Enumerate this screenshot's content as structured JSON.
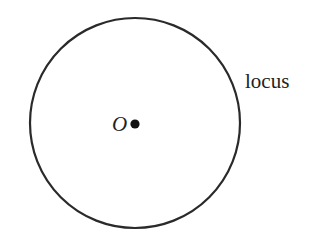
{
  "diagram": {
    "type": "locus-circle",
    "center_point": {
      "label": "O",
      "cx": 135,
      "cy": 124
    },
    "circle": {
      "cx": 135,
      "cy": 123,
      "r": 105,
      "stroke": "#2a2a2a",
      "stroke_width": 2.2
    },
    "locus_label": "locus",
    "colors": {
      "background": "#ffffff",
      "ink": "#222222"
    }
  }
}
